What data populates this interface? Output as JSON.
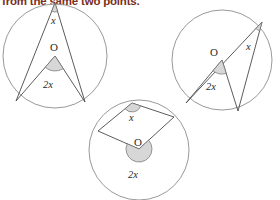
{
  "caption": {
    "text": "from the same two points."
  },
  "colors": {
    "caption_text": "#7a2f1d",
    "circle_stroke": "#8d8d8d",
    "line_stroke": "#4a4a4a",
    "wedge_fill": "#d7d7d7",
    "wedge_stroke": "#6e6e6e",
    "label_text": "#2b2b2b",
    "background": "#ffffff"
  },
  "figures": [
    {
      "id": "circle-left",
      "name": "inscribed-angle-acute",
      "circle": {
        "cx": 55,
        "cy": 56,
        "r": 52
      },
      "points": {
        "apex": {
          "x": 55,
          "y": 3
        },
        "left": {
          "x": 16,
          "y": 101
        },
        "right": {
          "x": 85,
          "y": 102
        },
        "center": {
          "x": 55,
          "y": 56
        }
      },
      "labels": {
        "inscribed": "x",
        "center": "O",
        "central": "2x"
      },
      "label_positions": {
        "inscribed": {
          "x": 51,
          "y": 24
        },
        "center": {
          "x": 50,
          "y": 51
        },
        "central": {
          "x": 43,
          "y": 88
        }
      }
    },
    {
      "id": "circle-right",
      "name": "inscribed-angle-reflex-diameter",
      "circle": {
        "cx": 222,
        "cy": 60,
        "r": 50
      },
      "points": {
        "apex": {
          "x": 262,
          "y": 22
        },
        "left": {
          "x": 186,
          "y": 103
        },
        "right": {
          "x": 238,
          "y": 111
        },
        "center": {
          "x": 222,
          "y": 60
        }
      },
      "labels": {
        "inscribed": "x",
        "center": "O",
        "central": "2x"
      },
      "label_positions": {
        "inscribed": {
          "x": 246,
          "y": 50
        },
        "center": {
          "x": 210,
          "y": 56
        },
        "central": {
          "x": 206,
          "y": 90
        }
      }
    },
    {
      "id": "circle-bottom",
      "name": "inscribed-angle-obtuse",
      "circle": {
        "cx": 139,
        "cy": 150,
        "r": 50
      },
      "points": {
        "apex": {
          "x": 132,
          "y": 103
        },
        "left": {
          "x": 98,
          "y": 131
        },
        "right": {
          "x": 174,
          "y": 117
        },
        "center": {
          "x": 139,
          "y": 149
        }
      },
      "labels": {
        "inscribed": "x",
        "center": "O",
        "central": "2x"
      },
      "label_positions": {
        "inscribed": {
          "x": 129,
          "y": 121
        },
        "center": {
          "x": 134,
          "y": 146
        },
        "central": {
          "x": 128,
          "y": 178
        }
      }
    }
  ]
}
